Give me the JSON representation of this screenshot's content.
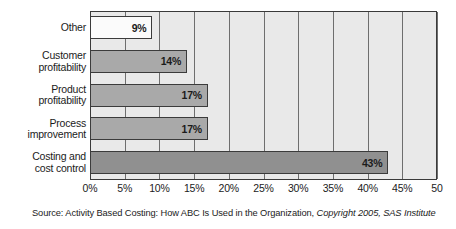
{
  "chart_data": {
    "type": "bar",
    "orientation": "horizontal",
    "title": "",
    "xlabel": "",
    "ylabel": "",
    "categories": [
      "Other",
      "Customer profitability",
      "Product profitability",
      "Process improvement",
      "Costing and cost control"
    ],
    "category_lines": [
      [
        "Other"
      ],
      [
        "Customer",
        "profitability"
      ],
      [
        "Product",
        "profitability"
      ],
      [
        "Process",
        "improvement"
      ],
      [
        "Costing and",
        "cost control"
      ]
    ],
    "values": [
      9,
      14,
      17,
      17,
      43
    ],
    "data_labels": [
      "9%",
      "14%",
      "17%",
      "17%",
      "43%"
    ],
    "bar_colors": [
      "#fbfbfb",
      "#a9a9a9",
      "#a9a9a9",
      "#a9a9a9",
      "#909090"
    ],
    "xlim": [
      0,
      50
    ],
    "xticks": [
      0,
      5,
      10,
      15,
      20,
      25,
      30,
      35,
      40,
      45,
      50
    ],
    "xtick_labels": [
      "0%",
      "5%",
      "10%",
      "15%",
      "20%",
      "25%",
      "30%",
      "35%",
      "40%",
      "45%",
      "50"
    ],
    "grid": true,
    "grid_axis": "x",
    "legend": false,
    "plot_background": "#e9e9e9",
    "border_color": "#3a3a3a"
  },
  "source": {
    "prefix": "Source: Activity Based Costing: How ABC Is Used in the Organization, ",
    "italic_part": "Copyright 2005, SAS Institute",
    "second_line": ""
  }
}
